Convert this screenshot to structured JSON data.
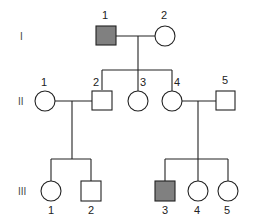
{
  "diagram": {
    "type": "pedigree",
    "colors": {
      "affected_fill": "#808080",
      "unaffected_fill": "#ffffff",
      "stroke": "#222222"
    },
    "generations": [
      {
        "label": "I",
        "individuals": [
          {
            "id": "1",
            "sex": "male",
            "affected": true
          },
          {
            "id": "2",
            "sex": "female",
            "affected": false
          }
        ]
      },
      {
        "label": "II",
        "individuals": [
          {
            "id": "1",
            "sex": "female",
            "affected": false
          },
          {
            "id": "2",
            "sex": "male",
            "affected": false
          },
          {
            "id": "3",
            "sex": "female",
            "affected": false
          },
          {
            "id": "4",
            "sex": "female",
            "affected": false
          },
          {
            "id": "5",
            "sex": "male",
            "affected": false
          }
        ]
      },
      {
        "label": "III",
        "individuals": [
          {
            "id": "1",
            "sex": "female",
            "affected": false
          },
          {
            "id": "2",
            "sex": "male",
            "affected": false
          },
          {
            "id": "3",
            "sex": "male",
            "affected": true
          },
          {
            "id": "4",
            "sex": "female",
            "affected": false
          },
          {
            "id": "5",
            "sex": "female",
            "affected": false
          }
        ]
      }
    ],
    "matings": [
      {
        "parents": [
          "I-1",
          "I-2"
        ],
        "children": [
          "II-2",
          "II-3",
          "II-4"
        ]
      },
      {
        "parents": [
          "II-1",
          "II-2"
        ],
        "children": [
          "III-1",
          "III-2"
        ]
      },
      {
        "parents": [
          "II-4",
          "II-5"
        ],
        "children": [
          "III-3",
          "III-4",
          "III-5"
        ]
      }
    ]
  }
}
